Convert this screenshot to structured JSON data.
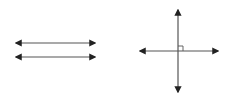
{
  "diagram": {
    "colors": {
      "line": "#555555",
      "arrow": "#222222",
      "background": "#ffffff"
    },
    "parallel_lines": [
      {
        "x1": 16,
        "y1": 43,
        "x2": 95,
        "y2": 43,
        "arrows": "both"
      },
      {
        "x1": 16,
        "y1": 57,
        "x2": 95,
        "y2": 57,
        "arrows": "both"
      }
    ],
    "perpendicular_lines": {
      "horizontal": {
        "x1": 140,
        "y1": 51,
        "x2": 218,
        "y2": 51,
        "arrows": "both"
      },
      "vertical": {
        "x1": 178,
        "y1": 10,
        "x2": 178,
        "y2": 92,
        "arrows": "both"
      },
      "right_angle_marker": {
        "x": 178,
        "y": 46,
        "size": 5
      }
    }
  }
}
